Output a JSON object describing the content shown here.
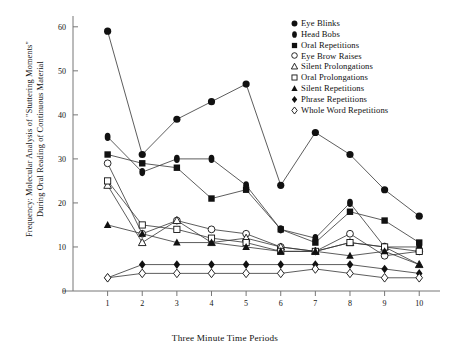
{
  "chart_data": {
    "type": "line",
    "title": "",
    "xlabel": "Three Minute Time Periods",
    "ylabel": "Frequency:  Molecular Analysis of \"Stuttering Moments\"\nDuring Oral Reading of Continuous Material",
    "x": [
      1,
      2,
      3,
      4,
      5,
      6,
      7,
      8,
      9,
      10
    ],
    "xticklabels": [
      "1",
      "2",
      "3",
      "4",
      "5",
      "6",
      "7",
      "8",
      "9",
      "10"
    ],
    "yticklabels": [
      "0",
      "10",
      "20",
      "30",
      "40",
      "50",
      "60"
    ],
    "yticks": [
      0,
      10,
      20,
      30,
      40,
      50,
      60
    ],
    "ylim": [
      0,
      62
    ],
    "xlim": [
      0,
      10.6
    ],
    "grid": false,
    "legend_position": "top-right",
    "series": [
      {
        "name": "Eye Blinks",
        "marker": "filled-circle",
        "values": [
          59,
          31,
          39,
          43,
          47,
          24,
          36,
          31,
          23,
          17
        ]
      },
      {
        "name": "Head Bobs",
        "marker": "filled-ellipse",
        "values": [
          35,
          27,
          30,
          30,
          24,
          14,
          12,
          20,
          10,
          10
        ]
      },
      {
        "name": "Oral Repetitions",
        "marker": "filled-square",
        "values": [
          31,
          29,
          28,
          21,
          23,
          14,
          11,
          18,
          16,
          11
        ]
      },
      {
        "name": "Eye Brow Raises",
        "marker": "open-circle",
        "values": [
          29,
          13,
          16,
          14,
          13,
          10,
          9,
          13,
          8,
          9
        ]
      },
      {
        "name": "Silent Prolongations",
        "marker": "open-triangle",
        "values": [
          24,
          11,
          16,
          11,
          12,
          10,
          9,
          11,
          10,
          6
        ]
      },
      {
        "name": "Oral Prolongations",
        "marker": "open-square",
        "values": [
          25,
          15,
          14,
          12,
          11,
          9,
          9,
          11,
          10,
          9
        ]
      },
      {
        "name": "Silent Repetitions",
        "marker": "filled-triangle",
        "values": [
          15,
          13,
          11,
          11,
          10,
          9,
          9,
          8,
          9,
          6
        ]
      },
      {
        "name": "Phrase Repetitions",
        "marker": "filled-diamond",
        "values": [
          3,
          6,
          6,
          6,
          6,
          6,
          6,
          6,
          5,
          4
        ]
      },
      {
        "name": "Whole Word Repetitions",
        "marker": "open-diamond",
        "values": [
          3,
          4,
          4,
          4,
          4,
          4,
          5,
          4,
          3,
          3
        ]
      }
    ]
  },
  "axis": {
    "x_title": "Three Minute Time Periods",
    "y_title": "Frequency:  Molecular Analysis of \"Stuttering Moments\"\nDuring Oral Reading of Continuous Material"
  }
}
